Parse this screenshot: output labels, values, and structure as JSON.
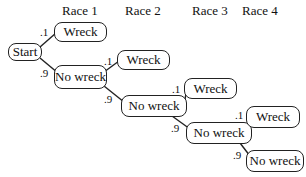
{
  "headers": [
    "Race 1",
    "Race 2",
    "Race 3",
    "Race 4"
  ],
  "nodes": {
    "start": "Start",
    "wreck1": "Wreck",
    "nowreck1": "No wreck",
    "wreck2": "Wreck",
    "nowreck2": "No wreck",
    "wreck3": "Wreck",
    "nowreck3": "No wreck",
    "wreck4": "Wreck",
    "nowreck4": "No wreck"
  },
  "probabilities": {
    "wreck": ".1",
    "no_wreck": ".9"
  }
}
